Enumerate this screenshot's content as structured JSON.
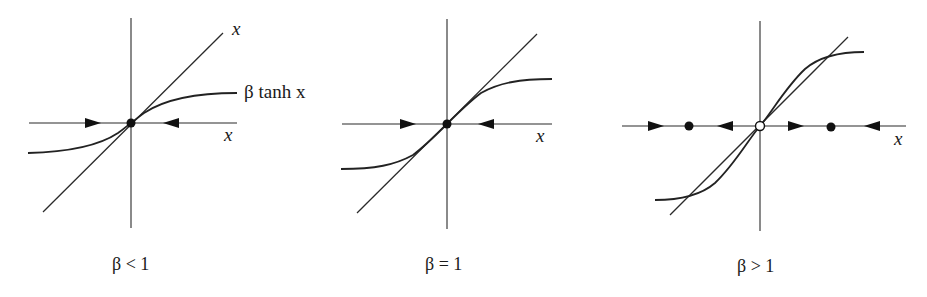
{
  "figure": {
    "width": 927,
    "height": 297,
    "colors": {
      "ink": "#1a1a1a",
      "background": "#ffffff"
    }
  },
  "chart_data": [
    {
      "type": "line",
      "title": "",
      "caption": "β < 1",
      "beta": 0.6,
      "series": [
        {
          "name": "x",
          "kind": "line y=x",
          "label": "x"
        },
        {
          "name": "β tanh x",
          "kind": "curve",
          "label": "β tanh x"
        }
      ],
      "axis_label_x": "x",
      "fixed_points": [
        {
          "x": 0,
          "stability": "stable"
        }
      ],
      "flow_arrows": [
        {
          "side": "left",
          "direction": "right"
        },
        {
          "side": "right",
          "direction": "left"
        }
      ]
    },
    {
      "type": "line",
      "title": "",
      "caption": "β = 1",
      "beta": 1.0,
      "series": [
        {
          "name": "x",
          "kind": "line y=x"
        },
        {
          "name": "β tanh x",
          "kind": "curve"
        }
      ],
      "axis_label_x": "x",
      "fixed_points": [
        {
          "x": 0,
          "stability": "stable"
        }
      ],
      "flow_arrows": [
        {
          "side": "left",
          "direction": "right"
        },
        {
          "side": "right",
          "direction": "left"
        }
      ]
    },
    {
      "type": "line",
      "title": "",
      "caption": "β > 1",
      "beta": 1.6,
      "series": [
        {
          "name": "x",
          "kind": "line y=x"
        },
        {
          "name": "β tanh x",
          "kind": "curve"
        }
      ],
      "axis_label_x": "x",
      "fixed_points": [
        {
          "x": "-x*",
          "stability": "stable"
        },
        {
          "x": 0,
          "stability": "unstable"
        },
        {
          "x": "x*",
          "stability": "stable"
        }
      ],
      "flow_arrows": [
        {
          "position": "far-left",
          "direction": "right"
        },
        {
          "position": "mid-left",
          "direction": "left"
        },
        {
          "position": "mid-right",
          "direction": "right"
        },
        {
          "position": "far-right",
          "direction": "left"
        }
      ]
    }
  ],
  "labels": {
    "panel1": {
      "line_label": "x",
      "curve_label": "β tanh x",
      "axis_label": "x",
      "caption": "β < 1"
    },
    "panel2": {
      "axis_label": "x",
      "caption": "β = 1"
    },
    "panel3": {
      "axis_label": "x",
      "caption": "β > 1"
    }
  },
  "geometry": {
    "panel1": {
      "vaxis": [
        131,
        18,
        131,
        228
      ],
      "haxis": [
        29,
        123,
        237,
        123
      ],
      "diag": [
        43,
        212,
        223,
        33
      ],
      "curve": "M28,153 C70,152 100,145 118,133 C125,128 128,125 131,123 C134,121 137,118 144,113 C162,101 192,93 237,93",
      "arrows": [
        [
          101,
          123,
          "right"
        ],
        [
          163,
          123,
          "left"
        ]
      ],
      "stable_points": [
        [
          131,
          123
        ]
      ],
      "unstable_points": [],
      "line_label_pos": [
        232,
        35
      ],
      "curve_label_pos": [
        244,
        98
      ],
      "axis_label_pos": [
        224,
        141
      ],
      "caption_pos": [
        112,
        270
      ]
    },
    "panel2": {
      "vaxis": [
        447,
        19,
        447,
        229
      ],
      "haxis": [
        342,
        124,
        552,
        124
      ],
      "diag": [
        357,
        213,
        537,
        34
      ],
      "curve": "M341,169 C375,169 395,165 413,155 C425,146 437,134 447,124 C457,114 469,102 481,93 C499,83 519,79 552,79",
      "arrows": [
        [
          416,
          124,
          "right"
        ],
        [
          478,
          124,
          "left"
        ]
      ],
      "stable_points": [
        [
          447,
          124
        ]
      ],
      "unstable_points": [],
      "axis_label_pos": [
        536,
        142
      ],
      "caption_pos": [
        425,
        270
      ]
    },
    "panel3": {
      "vaxis": [
        760,
        21,
        760,
        231
      ],
      "haxis": [
        622,
        126,
        906,
        126
      ],
      "diag": [
        670,
        215,
        848,
        37
      ],
      "curve": "M655,200 C680,200 700,196 715,183 C735,164 748,140 760,126 C772,112 785,88 805,69 C820,56 840,52 864,52",
      "arrows": [
        [
          664,
          126,
          "right"
        ],
        [
          717,
          126,
          "left"
        ],
        [
          804,
          126,
          "right"
        ],
        [
          864,
          126,
          "left"
        ]
      ],
      "stable_points": [
        [
          689,
          126
        ],
        [
          831,
          127
        ]
      ],
      "unstable_points": [
        [
          760,
          126
        ]
      ],
      "axis_label_pos": [
        894,
        145
      ],
      "caption_pos": [
        737,
        272
      ]
    }
  }
}
